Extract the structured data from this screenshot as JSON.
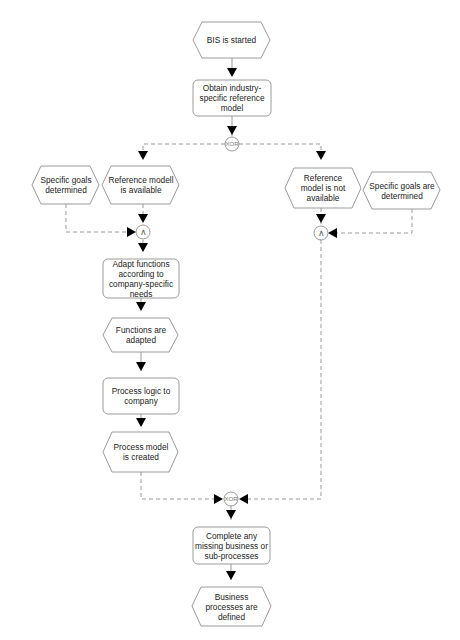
{
  "diagram": {
    "type": "EPC (Event-driven Process Chain)",
    "colors": {
      "stroke": "#9a9a9a",
      "arrow": "#000000",
      "connector": "#a0a0a0",
      "text": "#222222",
      "background": "#ffffff"
    },
    "nodes": {
      "e_start": {
        "kind": "event",
        "text": "BIS is started"
      },
      "f_obtain": {
        "kind": "function",
        "text": "Obtain industry-specific reference model"
      },
      "x_split": {
        "kind": "operator",
        "text": "XOR"
      },
      "e_ref_avail": {
        "kind": "event",
        "text": "Reference modell is available"
      },
      "e_goals_left": {
        "kind": "event",
        "text": "Specific goals determined"
      },
      "a_left": {
        "kind": "operator",
        "text": "∧"
      },
      "f_adapt": {
        "kind": "function",
        "text": "Adapt functions according to company-specific needs"
      },
      "e_adapted": {
        "kind": "event",
        "text": "Functions are adapted"
      },
      "f_logic": {
        "kind": "function",
        "text": "Process logic to company"
      },
      "e_model": {
        "kind": "event",
        "text": "Process model is created"
      },
      "e_ref_not": {
        "kind": "event",
        "text": "Reference model is not available"
      },
      "e_goals_right": {
        "kind": "event",
        "text": "Specific goals are determined"
      },
      "a_right": {
        "kind": "operator",
        "text": "∧"
      },
      "x_join": {
        "kind": "operator",
        "text": "XOR"
      },
      "f_complete": {
        "kind": "function",
        "text": "Complete any missing business or sub-processes"
      },
      "e_end": {
        "kind": "event",
        "text": "Business processes are defined"
      }
    },
    "edges": [
      [
        "e_start",
        "f_obtain"
      ],
      [
        "f_obtain",
        "x_split"
      ],
      [
        "x_split",
        "e_ref_avail"
      ],
      [
        "x_split",
        "e_ref_not"
      ],
      [
        "e_ref_avail",
        "a_left"
      ],
      [
        "e_goals_left",
        "a_left"
      ],
      [
        "a_left",
        "f_adapt"
      ],
      [
        "f_adapt",
        "e_adapted"
      ],
      [
        "e_adapted",
        "f_logic"
      ],
      [
        "f_logic",
        "e_model"
      ],
      [
        "e_model",
        "x_join"
      ],
      [
        "e_ref_not",
        "a_right"
      ],
      [
        "e_goals_right",
        "a_right"
      ],
      [
        "a_right",
        "x_join"
      ],
      [
        "x_join",
        "f_complete"
      ],
      [
        "f_complete",
        "e_end"
      ]
    ]
  }
}
